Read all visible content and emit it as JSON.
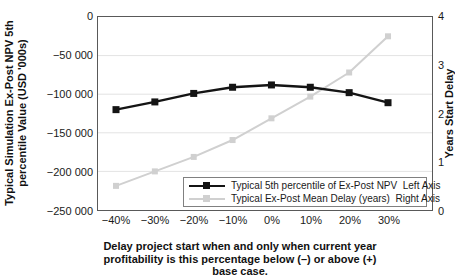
{
  "chart_data": {
    "type": "line",
    "title": "",
    "x_tick_labels": [
      "−40%",
      "−30%",
      "−20%",
      "−10%",
      "0%",
      "10%",
      "20%",
      "30%"
    ],
    "x_axis": {
      "title_lines": [
        "Delay project start when and only when current year",
        "profitability is this percentage below (–) or above (+)",
        "base case."
      ]
    },
    "left_axis": {
      "title_line1": "Typical Simulation Ex-Post NPV 5th",
      "title_line2": "percentile Value (USD '000s)",
      "min": -250000,
      "max": 0,
      "tick_labels": [
        "0",
        "−50 000",
        "−100 000",
        "−150 000",
        "−200 000",
        "−250 000"
      ]
    },
    "right_axis": {
      "title": "Years Start Delay",
      "min": 0,
      "max": 4,
      "tick_labels": [
        "4",
        "3",
        "2",
        "1",
        "0"
      ]
    },
    "series": [
      {
        "name": "Typical 5th percentile of Ex-Post NPV  Left Axis",
        "axis": "left",
        "color": "#141414",
        "marker": "square",
        "values": [
          -120000,
          -110000,
          -99000,
          -91000,
          -88000,
          -91000,
          -98000,
          -111000
        ]
      },
      {
        "name": "Typical Ex-Post Mean Delay (years)  Right Axis",
        "axis": "right",
        "color": "#d0d0d0",
        "marker": "square",
        "values": [
          0.5,
          0.8,
          1.1,
          1.45,
          1.9,
          2.35,
          2.85,
          3.6
        ]
      }
    ],
    "grid": "horizontal at left-axis ticks",
    "grid_color": "#e3e3e3",
    "legend_position": "inside bottom-right"
  }
}
